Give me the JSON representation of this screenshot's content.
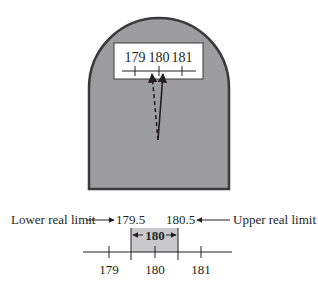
{
  "scale": {
    "window_labels": [
      "179",
      "180",
      "181"
    ],
    "pointer_dashed": "true value",
    "pointer_solid": "measured value"
  },
  "number_line": {
    "lower_limit_label": "Lower real limit",
    "lower_limit_value": "179.5",
    "upper_limit_value": "180.5",
    "upper_limit_label": "Upper real limit",
    "interval_label": "180",
    "tick_labels": [
      "179",
      "180",
      "181"
    ]
  },
  "colors": {
    "scale_body": "#9d9d9f",
    "scale_outline": "#3a3a3a",
    "interval_fill": "#c9c9cb",
    "ink": "#231f20"
  }
}
